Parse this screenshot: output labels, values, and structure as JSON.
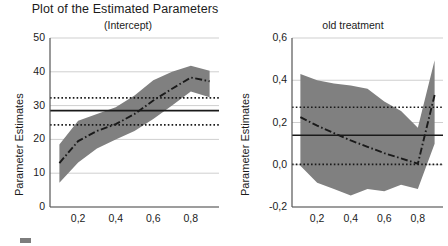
{
  "figure": {
    "title": "Plot of the Estimated Parameters",
    "background": "#ffffff",
    "band_color": "#808080",
    "line_color": "#1a1a1a",
    "grid_color": "#cfcfcf"
  },
  "legend": {
    "swatch_label": "confidence-band-swatch"
  },
  "chart_data": [
    {
      "type": "line",
      "panel": "left",
      "title": "(Intercept)",
      "xlabel": "",
      "ylabel": "Parameter Estimates",
      "xlim": [
        0.05,
        0.95
      ],
      "ylim": [
        0,
        50
      ],
      "grid": true,
      "legend_position": "none",
      "xticks": [
        0.2,
        0.4,
        0.6,
        0.8
      ],
      "xticklabels": [
        "0,2",
        "0,4",
        "0,6",
        "0,8"
      ],
      "yticks": [
        0,
        10,
        20,
        30,
        40,
        50
      ],
      "yticklabels": [
        "0",
        "10",
        "20",
        "30",
        "40",
        "50"
      ],
      "x": [
        0.1,
        0.2,
        0.3,
        0.4,
        0.5,
        0.6,
        0.7,
        0.8,
        0.9
      ],
      "series": [
        {
          "name": "quantile estimate",
          "style": "dash-dot",
          "values": [
            13.0,
            19.5,
            22.5,
            24.5,
            27.5,
            31.5,
            35.0,
            38.3,
            37.2
          ]
        },
        {
          "name": "confidence band upper",
          "style": "band",
          "values": [
            18.5,
            25.5,
            27.5,
            29.5,
            33.0,
            37.5,
            40.0,
            41.8,
            40.3
          ]
        },
        {
          "name": "confidence band lower",
          "style": "band",
          "values": [
            7.2,
            13.2,
            17.3,
            20.0,
            22.5,
            26.0,
            30.0,
            34.2,
            32.5
          ]
        }
      ],
      "reference_lines": [
        {
          "name": "ols estimate",
          "style": "solid",
          "value": 28.5
        },
        {
          "name": "ols upper bound",
          "style": "dotted",
          "value": 32.3
        },
        {
          "name": "ols lower bound",
          "style": "dotted",
          "value": 24.3
        }
      ]
    },
    {
      "type": "line",
      "panel": "right",
      "title": "old treatment",
      "xlabel": "",
      "ylabel": "Parameter Estimates",
      "xlim": [
        0.05,
        0.95
      ],
      "ylim": [
        -0.2,
        0.6
      ],
      "grid": true,
      "legend_position": "none",
      "xticks": [
        0.2,
        0.4,
        0.6,
        0.8
      ],
      "xticklabels": [
        "0,2",
        "0,4",
        "0,6",
        "0,8"
      ],
      "yticks": [
        -0.2,
        0.0,
        0.2,
        0.4,
        0.6
      ],
      "yticklabels": [
        "-0,2",
        "0,0",
        "0,2",
        "0,4",
        "0,6"
      ],
      "x": [
        0.1,
        0.2,
        0.3,
        0.4,
        0.5,
        0.6,
        0.7,
        0.8,
        0.9
      ],
      "series": [
        {
          "name": "quantile estimate",
          "style": "dash-dot",
          "values": [
            0.225,
            0.185,
            0.15,
            0.115,
            0.085,
            0.055,
            0.03,
            0.005,
            0.33
          ]
        },
        {
          "name": "confidence band upper",
          "style": "band",
          "values": [
            0.43,
            0.4,
            0.385,
            0.375,
            0.36,
            0.3,
            0.255,
            0.175,
            0.495
          ]
        },
        {
          "name": "confidence band lower",
          "style": "band",
          "values": [
            -0.005,
            -0.085,
            -0.115,
            -0.145,
            -0.115,
            -0.125,
            -0.095,
            -0.115,
            0.1
          ]
        }
      ],
      "reference_lines": [
        {
          "name": "ols estimate",
          "style": "solid",
          "value": 0.14
        },
        {
          "name": "ols upper bound",
          "style": "dotted",
          "value": 0.272
        },
        {
          "name": "ols lower bound",
          "style": "dotted",
          "value": 0.002
        }
      ]
    }
  ]
}
